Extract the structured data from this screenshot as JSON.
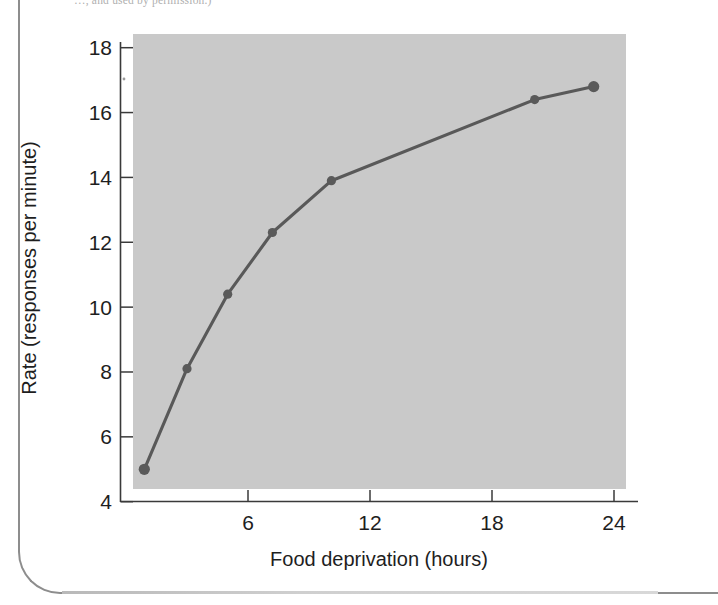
{
  "caption_sliver": "…, and used by permission.)",
  "colors": {
    "plot_background": "#c9c9c9",
    "line": "#595959",
    "marker": "#5a5a5a",
    "axis": "#3a3a3a",
    "text": "#1e1e1e",
    "page_border": "#8d8d8d"
  },
  "chart_data": {
    "type": "line",
    "title": "",
    "subtitle": "",
    "xlabel": "Food deprivation (hours)",
    "ylabel": "Rate (responses per minute)",
    "xlim": [
      0,
      24.6
    ],
    "ylim": [
      4,
      18
    ],
    "xticks": [
      6,
      12,
      18,
      24
    ],
    "xtick_labels": [
      "6",
      "12",
      "18",
      "24"
    ],
    "yticks": [
      4,
      6,
      8,
      10,
      12,
      14,
      16,
      18
    ],
    "ytick_labels": [
      "4",
      "6",
      "8",
      "10",
      "12",
      "14",
      "16",
      "18"
    ],
    "grid": false,
    "legend": null,
    "legend_position": "none",
    "annotations": [],
    "series": [
      {
        "name": "Response rate",
        "marker": "circle",
        "x": [
          0.9,
          3.0,
          5.0,
          7.2,
          10.1,
          20.1,
          23.0
        ],
        "y": [
          5.0,
          8.1,
          10.4,
          12.3,
          13.9,
          16.4,
          16.8
        ],
        "points": [
          {
            "x": 0.9,
            "y": 5.0
          },
          {
            "x": 3.0,
            "y": 8.1
          },
          {
            "x": 5.0,
            "y": 10.4
          },
          {
            "x": 7.2,
            "y": 12.3
          },
          {
            "x": 10.1,
            "y": 13.9
          },
          {
            "x": 20.1,
            "y": 16.4
          },
          {
            "x": 23.0,
            "y": 16.8
          }
        ]
      }
    ]
  }
}
